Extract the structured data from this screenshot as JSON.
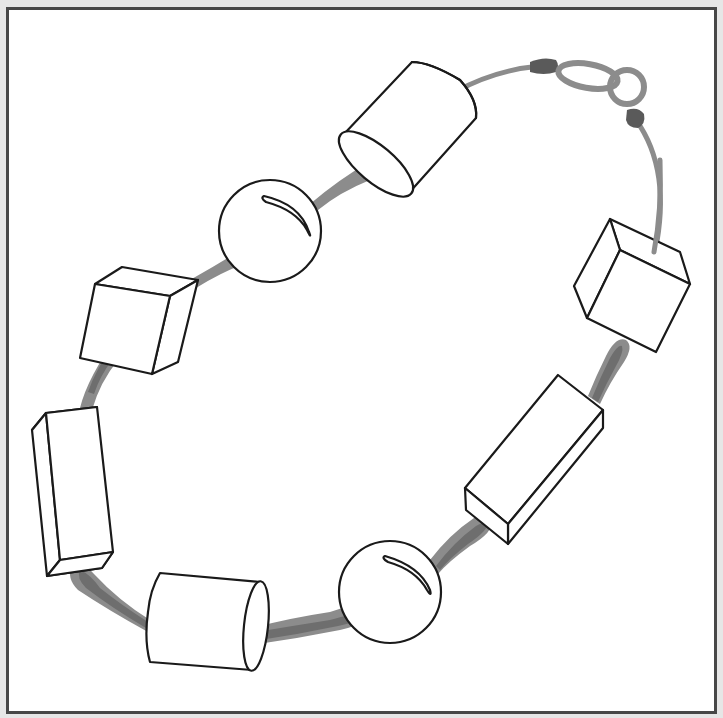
{
  "figure": {
    "frame_color": "#474747",
    "background": "#ffffff",
    "cord_color": "#8c8c8c",
    "crimp_color": "#5a5a5a",
    "outline_color": "#1a1a1a"
  },
  "beads": [
    {
      "shape": "cylinder",
      "position": "top"
    },
    {
      "shape": "sphere",
      "position": "upper-left"
    },
    {
      "shape": "cube",
      "position": "left-upper"
    },
    {
      "shape": "rectangular-prism",
      "position": "left"
    },
    {
      "shape": "cylinder",
      "position": "bottom-left"
    },
    {
      "shape": "sphere",
      "position": "bottom"
    },
    {
      "shape": "rectangular-prism",
      "position": "right-lower"
    },
    {
      "shape": "cube",
      "position": "right-upper"
    }
  ],
  "clasp": {
    "type": "jump-ring-and-loop",
    "position": "top-right"
  }
}
